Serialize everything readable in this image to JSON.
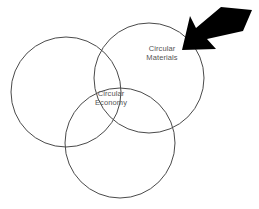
{
  "diagram": {
    "type": "venn",
    "background_color": "#ffffff",
    "stroke_color": "#4a4a4a",
    "text_color": "#555555",
    "arrow_color": "#000000",
    "circles": [
      {
        "id": "left-circle",
        "name": "left-circle",
        "cx": 66,
        "cy": 92,
        "r": 55,
        "label": ""
      },
      {
        "id": "right-circle",
        "name": "right-circle",
        "cx": 149,
        "cy": 78,
        "r": 55,
        "label": "Circular Materials"
      },
      {
        "id": "bottom-circle",
        "name": "bottom-circle",
        "cx": 120,
        "cy": 143,
        "r": 55,
        "label": ""
      }
    ],
    "labels": {
      "circular_materials": {
        "line1": "Circular",
        "line2": "Materials"
      },
      "circular_economy": {
        "line1": "Circular",
        "line2": "Economy"
      }
    },
    "annotation": {
      "arrow": {
        "name": "pointer-arrow",
        "direction": "down-left",
        "points": "250,13 217,11 193,32 189,23 181,47 210,48 203,40 240,30"
      }
    }
  }
}
